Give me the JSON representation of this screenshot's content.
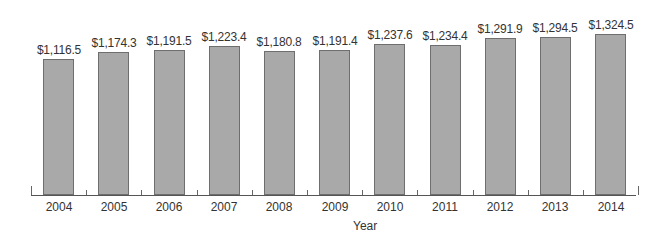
{
  "chart_data": {
    "type": "bar",
    "title": "",
    "xlabel": "Year",
    "ylabel": "",
    "categories": [
      "2004",
      "2005",
      "2006",
      "2007",
      "2008",
      "2009",
      "2010",
      "2011",
      "2012",
      "2013",
      "2014"
    ],
    "values": [
      1116.5,
      1174.3,
      1191.5,
      1223.4,
      1180.8,
      1191.4,
      1237.6,
      1234.4,
      1291.9,
      1294.5,
      1324.5
    ],
    "value_labels": [
      "$1,116.5",
      "$1,174.3",
      "$1,191.5",
      "$1,223.4",
      "$1,180.8",
      "$1,191.4",
      "$1,237.6",
      "$1,234.4",
      "$1,291.9",
      "$1,294.5",
      "$1,324.5"
    ],
    "ylim": [
      0,
      1324.5
    ],
    "grid": false,
    "legend": null,
    "bar_color": "#a9a9a9",
    "bar_edge_color": "#6e6e6e"
  }
}
